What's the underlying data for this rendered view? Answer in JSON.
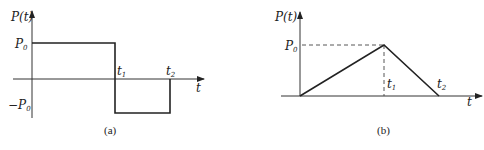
{
  "diagrams": [
    {
      "id": "a",
      "caption": "(a)",
      "y_axis_label": "P(t)",
      "x_axis_label": "t",
      "level_labels": {
        "pos_main": "P",
        "pos_sub": "0",
        "neg_prefix": "−",
        "neg_main": "P",
        "neg_sub": "0"
      },
      "time_labels": [
        {
          "main": "t",
          "sub": "1"
        },
        {
          "main": "t",
          "sub": "2"
        }
      ],
      "description": "Rectangular pulse: P0 from 0 to t1, then −P0 from t1 to t2, then 0"
    },
    {
      "id": "b",
      "caption": "(b)",
      "y_axis_label": "P(t)",
      "x_axis_label": "t",
      "level_labels": {
        "pos_main": "P",
        "pos_sub": "0"
      },
      "time_labels": [
        {
          "main": "t",
          "sub": "1"
        },
        {
          "main": "t",
          "sub": "2"
        }
      ],
      "description": "Triangular pulse: rises linearly from 0 to P0 at t1, falls linearly to 0 at t2"
    }
  ],
  "colors": {
    "line": "#222222",
    "axis": "#333333",
    "background": "#ffffff"
  }
}
